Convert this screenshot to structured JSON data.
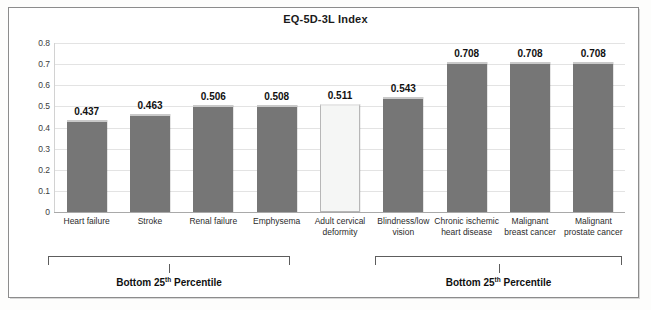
{
  "chart_data": {
    "type": "bar",
    "title": "EQ-5D-3L Index",
    "xlabel": "",
    "ylabel": "",
    "ylim": [
      0,
      0.8
    ],
    "ytick_labels": [
      "0.8",
      "0.7",
      "0.6",
      "0.5",
      "0.4",
      "0.3",
      "0.2",
      "0.1",
      "0"
    ],
    "ytick_values": [
      0.8,
      0.7,
      0.6,
      0.5,
      0.4,
      0.3,
      0.2,
      0.1,
      0
    ],
    "grid": true,
    "legend": null,
    "categories": [
      "Heart failure",
      "Stroke",
      "Renal failure",
      "Emphysema",
      "Adult cervical deformity",
      "Blindness/low vision",
      "Chronic ischemic heart disease",
      "Malignant breast cancer",
      "Malignant prostate cancer"
    ],
    "values": [
      0.437,
      0.463,
      0.506,
      0.508,
      0.511,
      0.543,
      0.708,
      0.708,
      0.708
    ],
    "data_labels": [
      "0.437",
      "0.463",
      "0.506",
      "0.508",
      "0.511",
      "0.543",
      "0.708",
      "0.708",
      "0.708"
    ],
    "bar_colors": [
      "#767676",
      "#767676",
      "#767676",
      "#767676",
      "#f5f6f5",
      "#767676",
      "#767676",
      "#767676",
      "#767676"
    ],
    "highlighted_category": "Adult cervical deformity",
    "annotations": [
      {
        "label": "Bottom 25th Percentile",
        "label_prefix": "Bottom 25",
        "label_sup": "th",
        "label_suffix": " Percentile",
        "covers": [
          "Heart failure",
          "Stroke",
          "Renal failure",
          "Emphysema"
        ]
      },
      {
        "label": "Bottom 25th Percentile",
        "label_prefix": "Bottom 25",
        "label_sup": "th",
        "label_suffix": " Percentile",
        "covers": [
          "Blindness/low vision",
          "Chronic ischemic heart disease",
          "Malignant breast cancer",
          "Malignant prostate cancer"
        ]
      }
    ]
  },
  "category_label_lines": [
    [
      "Heart failure"
    ],
    [
      "Stroke"
    ],
    [
      "Renal failure"
    ],
    [
      "Emphysema"
    ],
    [
      "Adult cervical",
      "deformity"
    ],
    [
      "Blindness/low",
      "vision"
    ],
    [
      "Chronic ischemic",
      "heart disease"
    ],
    [
      "Malignant",
      "breast cancer"
    ],
    [
      "Malignant",
      "prostate cancer"
    ]
  ],
  "colors": {
    "bar_fill": "#767676",
    "bar_highlight_fill": "#f5f6f5",
    "bar_top_edge": "#c9c9c9",
    "gridline": "#e3e3e3",
    "axis": "#a9a9a9",
    "text": "#1a1a1a",
    "frame": "#8c8c8c",
    "background": "#ffffff"
  }
}
